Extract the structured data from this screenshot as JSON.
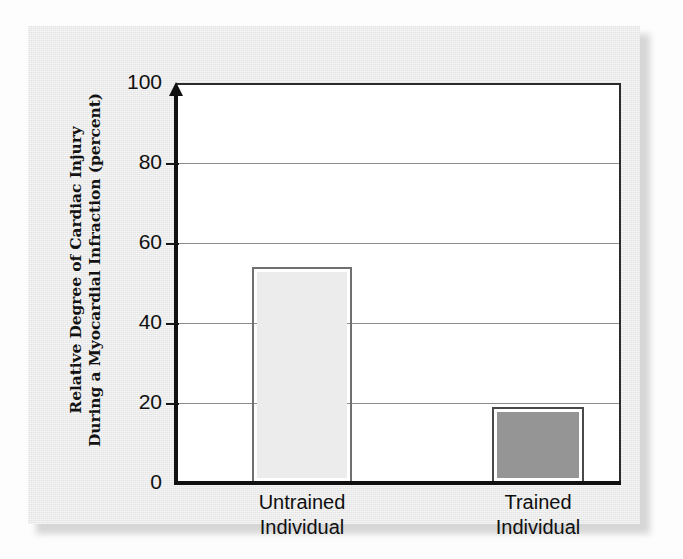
{
  "figure": {
    "background_color": "#e8e8e8",
    "plot_background_color": "#ffffff",
    "axis_color": "#111111",
    "gridline_color": "#8c8c8c"
  },
  "y_axis": {
    "title_line1": "Relative Degree of Cardiac Injury",
    "title_line2": "During a Myocardial Infraction (percent)",
    "ticks": [
      "0",
      "20",
      "40",
      "60",
      "80",
      "100"
    ]
  },
  "x_axis": {
    "categories": [
      {
        "line1": "Untrained",
        "line2": "Individual"
      },
      {
        "line1": "Trained",
        "line2": "Individual"
      }
    ]
  },
  "bars": [
    {
      "label": "Untrained Individual",
      "value": 54,
      "fill_color": "#ececec",
      "edge_color": "#707070"
    },
    {
      "label": "Trained Individual",
      "value": 19,
      "fill_color": "#959595",
      "edge_color": "#4a4a4a"
    }
  ],
  "chart_data": {
    "type": "bar",
    "title": "",
    "categories": [
      "Untrained Individual",
      "Trained Individual"
    ],
    "values": [
      54,
      19
    ],
    "xlabel": "",
    "ylabel": "Relative Degree of Cardiac Injury During a Myocardial Infraction (percent)",
    "ylim": [
      0,
      100
    ],
    "yticks": [
      0,
      20,
      40,
      60,
      80,
      100
    ],
    "grid": true,
    "legend": "none",
    "series": [
      {
        "name": "Relative degree of cardiac injury",
        "values": [
          54,
          19
        ]
      }
    ],
    "annotations": []
  }
}
